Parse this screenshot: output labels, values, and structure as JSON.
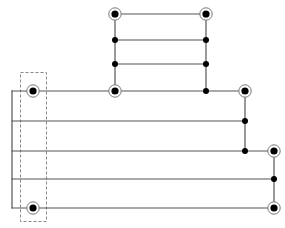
{
  "diagram": {
    "type": "circuit-graph",
    "width": 285,
    "height": 228,
    "colors": {
      "line": "#555555",
      "node": "#000000",
      "ring": "#777777",
      "background": "#ffffff",
      "dashed_box": "#888888"
    },
    "terminals": [
      {
        "id": "t1",
        "x": 115,
        "y": 14
      },
      {
        "id": "t2",
        "x": 206,
        "y": 14
      },
      {
        "id": "t3",
        "x": 33,
        "y": 91
      },
      {
        "id": "t4",
        "x": 115,
        "y": 91
      },
      {
        "id": "t5",
        "x": 245,
        "y": 91
      },
      {
        "id": "t6",
        "x": 274,
        "y": 151
      },
      {
        "id": "t7",
        "x": 33,
        "y": 208
      },
      {
        "id": "t8",
        "x": 274,
        "y": 208
      }
    ],
    "junctions": [
      {
        "id": "j1",
        "x": 115,
        "y": 40
      },
      {
        "id": "j2",
        "x": 206,
        "y": 40
      },
      {
        "id": "j3",
        "x": 115,
        "y": 64
      },
      {
        "id": "j4",
        "x": 206,
        "y": 64
      },
      {
        "id": "j5",
        "x": 206,
        "y": 91
      },
      {
        "id": "j6",
        "x": 245,
        "y": 121
      },
      {
        "id": "j7",
        "x": 245,
        "y": 151
      },
      {
        "id": "j8",
        "x": 274,
        "y": 179
      }
    ],
    "wires": [
      {
        "x1": 115,
        "y1": 14,
        "x2": 206,
        "y2": 14
      },
      {
        "x1": 115,
        "y1": 40,
        "x2": 206,
        "y2": 40
      },
      {
        "x1": 115,
        "y1": 64,
        "x2": 206,
        "y2": 64
      },
      {
        "x1": 115,
        "y1": 14,
        "x2": 115,
        "y2": 91
      },
      {
        "x1": 206,
        "y1": 14,
        "x2": 206,
        "y2": 91
      },
      {
        "x1": 12,
        "y1": 91,
        "x2": 245,
        "y2": 91
      },
      {
        "x1": 12,
        "y1": 121,
        "x2": 245,
        "y2": 121
      },
      {
        "x1": 12,
        "y1": 151,
        "x2": 274,
        "y2": 151
      },
      {
        "x1": 12,
        "y1": 179,
        "x2": 274,
        "y2": 179
      },
      {
        "x1": 12,
        "y1": 208,
        "x2": 274,
        "y2": 208
      },
      {
        "x1": 12,
        "y1": 91,
        "x2": 12,
        "y2": 208
      },
      {
        "x1": 245,
        "y1": 91,
        "x2": 245,
        "y2": 151
      },
      {
        "x1": 274,
        "y1": 151,
        "x2": 274,
        "y2": 208
      }
    ],
    "dashed_box": {
      "x": 20,
      "y": 72,
      "width": 26,
      "height": 149
    }
  }
}
